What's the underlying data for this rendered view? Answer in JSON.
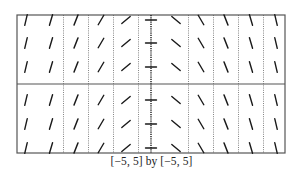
{
  "chart_data": {
    "type": "slope_field",
    "title": "",
    "caption": "[−5, 5] by [−5, 5]",
    "differential_equation_slope": "dy/dx = -x",
    "xlim": [
      -5,
      5
    ],
    "ylim": [
      -5,
      5
    ],
    "x_grid_dotted": [
      -4,
      -3,
      -2,
      -1,
      1,
      2,
      3,
      4
    ],
    "columns_x": [
      -5,
      -4,
      -3,
      -2,
      -1,
      0,
      1,
      2,
      3,
      4,
      5
    ],
    "column_slopes": [
      5,
      4,
      3,
      2,
      1,
      0,
      -1,
      -2,
      -3,
      -4,
      -5
    ],
    "rows_y": [
      4.5,
      3,
      1.5,
      -1.5,
      -3,
      -4.5
    ],
    "axes": {
      "x_axis_at": 0,
      "y_axis_at": 0,
      "y_axis_style": "dotted-with-ticks"
    },
    "grid": "vertical dotted lines at integer x",
    "legend": null
  },
  "frame": {
    "left": 17,
    "top": 15,
    "right": 285,
    "bottom": 153,
    "axis_y_px": 84,
    "axis_x_px": 151
  },
  "colors": {
    "stroke": "#1a1a1a",
    "frame": "#555555",
    "dotted": "#777777",
    "background": "#ffffff"
  }
}
